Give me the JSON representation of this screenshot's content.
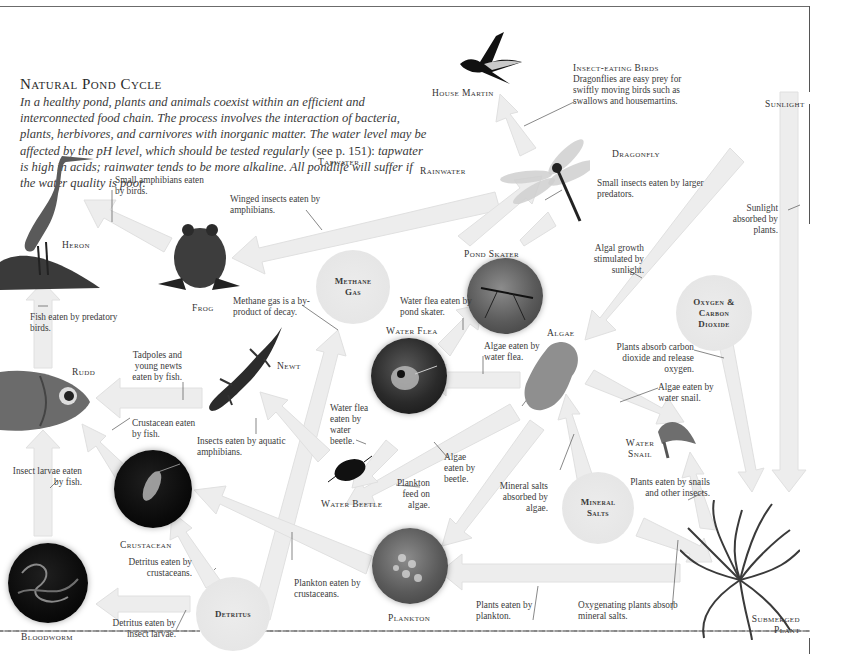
{
  "title": "Natural Pond Cycle",
  "intro": "In a healthy pond, plants and animals coexist within an efficient and interconnected food chain. The process involves the interaction of bacteria, plants, herbivores, and carnivores with inorganic matter. The water level may be affected by the pH level, which should be tested regularly",
  "intro_ref": " (see p. 151):",
  "intro_end": " tapwater is high in acids; rainwater tends to be more alkaline. All pondlife will suffer if the water quality is poor.",
  "organisms": {
    "house_martin": "House Martin",
    "dragonfly": "Dragonfly",
    "heron": "Heron",
    "frog": "Frog",
    "pond_skater": "Pond Skater",
    "water_flea": "Water Flea",
    "algae": "Algae",
    "newt": "Newt",
    "rudd": "Rudd",
    "water_snail": "Water Snail",
    "water_beetle": "Water Beetle",
    "crustacean": "Crustacean",
    "plankton": "Plankton",
    "bloodworm": "Bloodworm",
    "submerged_plant": "Submerged Plant"
  },
  "elements": {
    "sunlight": "Sunlight",
    "tapwater": "Tapwater",
    "rainwater": "Rainwater",
    "methane_gas": "Methane Gas",
    "oxygen_co2": "Oxygen & Carbon Dioxide",
    "mineral_salts": "Mineral Salts",
    "detritus": "Detritus"
  },
  "insect_eating_birds": {
    "heading": "Insect-eating Birds",
    "text": "Dragonflies are easy prey for swiftly moving birds such as swallows and housemartins."
  },
  "notes": {
    "small_amphibians": "Small amphibians eaten by birds.",
    "winged_insects": "Winged insects eaten by amphibians.",
    "small_insects": "Small insects eaten by larger predators.",
    "sunlight_absorbed": "Sunlight absorbed by plants.",
    "algal_growth": "Algal growth stimulated by sunlight.",
    "methane_decay": "Methane gas is a by-product of decay.",
    "water_flea_skater": "Water flea eaten by pond skater.",
    "fish_birds": "Fish eaten by predatory birds.",
    "tadpoles": "Tadpoles and young newts eaten by fish.",
    "algae_flea": "Algae eaten by water flea.",
    "plants_absorb_co2": "Plants absorb carbon dioxide and release oxygen.",
    "algae_snail": "Algae eaten by water snail.",
    "crustacean_fish": "Crustacean eaten by fish.",
    "insects_amphibians": "Insects eaten by aquatic amphibians.",
    "flea_beetle": "Water flea eaten by water beetle.",
    "algae_beetle": "Algae eaten by beetle.",
    "plankton_algae": "Plankton feed on algae.",
    "mineral_algae": "Mineral salts absorbed by algae.",
    "plants_snails": "Plants eaten by snails and other insects.",
    "insect_larvae_fish": "Insect larvae eaten by fish.",
    "detritus_crustaceans": "Detritus eaten by crustaceans.",
    "plankton_crustaceans": "Plankton eaten by crustaceans.",
    "detritus_larvae": "Detritus eaten by insect larvae.",
    "plants_plankton": "Plants eaten by plankton.",
    "oxygenating_plants": "Oxygenating plants absorb mineral salts."
  },
  "colors": {
    "arrow": "#efefef",
    "arrow_edge": "#e2e2e2",
    "element_circle": "#e8e8e8",
    "text": "#2a2a2a",
    "frame": "#6b6b6b"
  }
}
